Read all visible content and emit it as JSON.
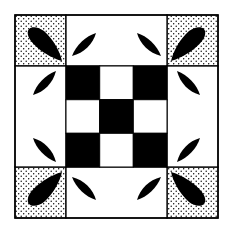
{
  "figure": {
    "colors": {
      "background": "#ffffff",
      "ink": "#000000",
      "dots": "#000000"
    },
    "layout": {
      "block": {
        "x": 15,
        "y": 15,
        "size": 203
      },
      "corner_size": 51,
      "center": {
        "x": 66,
        "y": 66,
        "size": 101
      },
      "center_grid": 3
    },
    "center_pattern": [
      [
        1,
        0,
        1
      ],
      [
        0,
        1,
        0
      ],
      [
        1,
        0,
        1
      ]
    ],
    "corner_fill": "stippled",
    "corner_motif": "teardrop-leaf",
    "strip_motif": "pointed-leaf"
  }
}
